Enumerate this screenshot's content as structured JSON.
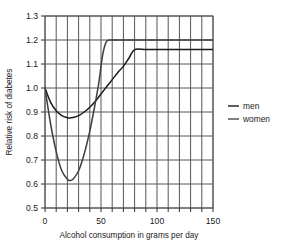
{
  "chart_data": {
    "type": "line",
    "title": "",
    "subtitle": "",
    "xlabel": "Alcohol consumption in grams per day",
    "ylabel": "Relative risk of diabetes",
    "xlim": [
      0,
      150
    ],
    "ylim": [
      0.5,
      1.3
    ],
    "xticks": [
      0,
      50,
      100,
      150
    ],
    "xtick_labels": [
      "0",
      "50",
      "100",
      "150"
    ],
    "x_minor_tick_step": 10,
    "yticks": [
      0.5,
      0.6,
      0.7,
      0.8,
      0.9,
      1.0,
      1.1,
      1.2,
      1.3
    ],
    "ytick_labels": [
      "0.5",
      "0.6",
      "0.7",
      "0.8",
      "0.9",
      "1.0",
      "1.1",
      "1.2",
      "1.3"
    ],
    "grid": true,
    "grid_color": "#555555",
    "legend_position": "right",
    "series": [
      {
        "name": "men",
        "color": "#1a1a1a",
        "x": [
          0,
          5,
          10,
          15,
          20,
          22,
          25,
          30,
          35,
          40,
          45,
          50,
          55,
          60,
          65,
          70,
          75,
          80,
          90,
          100,
          110,
          120,
          130,
          140,
          150
        ],
        "values": [
          1.0,
          0.94,
          0.905,
          0.885,
          0.876,
          0.875,
          0.877,
          0.885,
          0.9,
          0.92,
          0.945,
          0.975,
          1.005,
          1.035,
          1.065,
          1.09,
          1.125,
          1.16,
          1.16,
          1.16,
          1.16,
          1.16,
          1.16,
          1.16,
          1.16
        ]
      },
      {
        "name": "women",
        "color": "#3f3f3f",
        "x": [
          0,
          5,
          10,
          15,
          20,
          22,
          25,
          30,
          35,
          40,
          45,
          48,
          50,
          52,
          55,
          60,
          70,
          80,
          90,
          100,
          110,
          120,
          130,
          140,
          150
        ],
        "values": [
          1.0,
          0.85,
          0.735,
          0.655,
          0.62,
          0.615,
          0.62,
          0.655,
          0.725,
          0.82,
          0.94,
          1.02,
          1.09,
          1.15,
          1.195,
          1.2,
          1.2,
          1.2,
          1.2,
          1.2,
          1.2,
          1.2,
          1.2,
          1.2,
          1.2
        ]
      }
    ],
    "annotations": {
      "men_minimum": {
        "x": 22,
        "y": 0.875
      },
      "women_minimum": {
        "x": 22,
        "y": 0.615
      },
      "men_plateau_value": 1.16,
      "women_plateau_value": 1.2,
      "shared_start": {
        "x": 0,
        "y": 1.0
      }
    }
  },
  "legend": {
    "items": [
      {
        "label": "men",
        "color": "#1a1a1a"
      },
      {
        "label": "women",
        "color": "#4a4a4a"
      }
    ]
  }
}
